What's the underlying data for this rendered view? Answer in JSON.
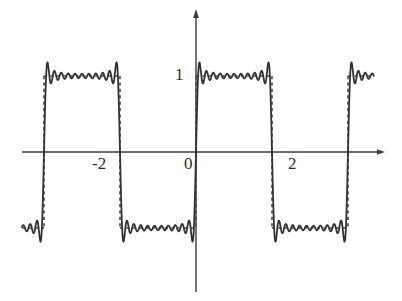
{
  "figure": {
    "title": "",
    "background_color": "#ffffff",
    "width": 402,
    "height": 301
  },
  "axes": {
    "x_axis": {
      "name": "x-axis",
      "pixel_y": 152,
      "pixel_x_start": 22,
      "pixel_x_end": 385,
      "arrow": "right",
      "color": "#3a3a3a"
    },
    "y_axis": {
      "name": "y-axis",
      "pixel_x": 196,
      "pixel_y_start": 10,
      "pixel_y_end": 292,
      "arrow": "up",
      "color": "#3a3a3a"
    },
    "origin_pixel": [
      196,
      152
    ],
    "x_scale_px_per_unit": 38,
    "y_scale_px_per_unit": 76
  },
  "tick_labels": {
    "neg_two": "-2",
    "zero": "0",
    "pos_two": "2",
    "one": "1"
  },
  "chart_data": {
    "type": "line",
    "title": "",
    "subtitle": "",
    "xlabel": "",
    "ylabel": "",
    "xlim": [
      -4.6,
      4.7
    ],
    "ylim": [
      -1.85,
      1.85
    ],
    "grid": false,
    "legend": null,
    "x_ticks": [
      -2,
      0,
      2
    ],
    "x_tick_labels": [
      "-2",
      "0",
      "2"
    ],
    "y_ticks": [
      1
    ],
    "y_tick_labels": [
      "1"
    ],
    "series": [
      {
        "name": "ideal-square-wave",
        "style": "dashed",
        "color": "#4a4a4a",
        "amplitude": 1,
        "period": 4,
        "jump_points": [
          -4,
          -2,
          0,
          2,
          4
        ],
        "values_description": "+1 on (0,2) and (-4,-2) and (4,6); -1 on (-2,0) and (2,4)",
        "levels": [
          1,
          -1
        ]
      },
      {
        "name": "fourier-partial-sum",
        "style": "solid",
        "color": "#333333",
        "harmonics": 11,
        "formula": "f(x) = (4/pi) * sum_{k odd, k<=21} sin(k*pi*x/2)/k",
        "overshoot_peak": 1.18,
        "undershoot_peak": -1.18,
        "ripple_count_per_plateau": 5
      }
    ],
    "sample_points": {
      "x_start": -4.58,
      "x_end": 4.68,
      "n_samples": 1400
    }
  }
}
